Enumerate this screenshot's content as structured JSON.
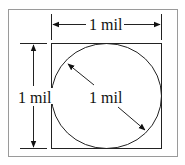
{
  "diagram": {
    "width_label": "1 mil",
    "height_label": "1 mil",
    "diameter_label": "1 mil",
    "colors": {
      "stroke": "#222222",
      "frame": "#9a9a9a",
      "background": "#ffffff"
    }
  }
}
